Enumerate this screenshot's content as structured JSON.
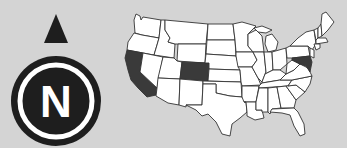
{
  "compass": {
    "label": "N",
    "icon": "north-compass-icon",
    "arrow": "north-arrow-icon",
    "colors": {
      "ring": "#1e1e1e",
      "inner": "#ffffff",
      "letter": "#ffffff"
    }
  },
  "map": {
    "name": "United States (contiguous)",
    "highlighted_states": [
      "California",
      "Colorado"
    ],
    "colors": {
      "background": "#d4d4d4",
      "state_fill": "#ffffff",
      "highlight_fill": "#3a3a3a",
      "border": "#333333"
    }
  }
}
